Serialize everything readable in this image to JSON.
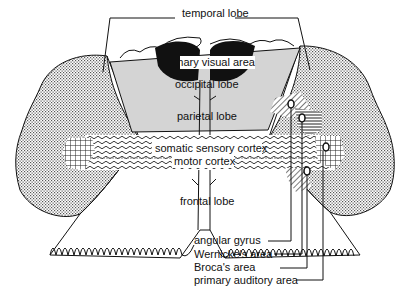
{
  "diagram": {
    "labels": {
      "temporal_lobe": "temporal lobe",
      "primary_visual_area": "primary visual area",
      "occipital_lobe": "occipital lobe",
      "parietal_lobe": "parietal lobe",
      "somatic_sensory_cortex": "somatic sensory cortex",
      "motor_cortex": "motor cortex",
      "frontal_lobe": "frontal lobe",
      "angular_gyrus": "angular gyrus",
      "wernickes_area": "Wernicke's area",
      "brocas_area": "Broca's area",
      "primary_auditory_area": "primary auditory area"
    },
    "colors": {
      "ink": "#111111",
      "occipital_fill": "#d4d4d4",
      "stipple": "#555555",
      "background": "#ffffff"
    }
  }
}
